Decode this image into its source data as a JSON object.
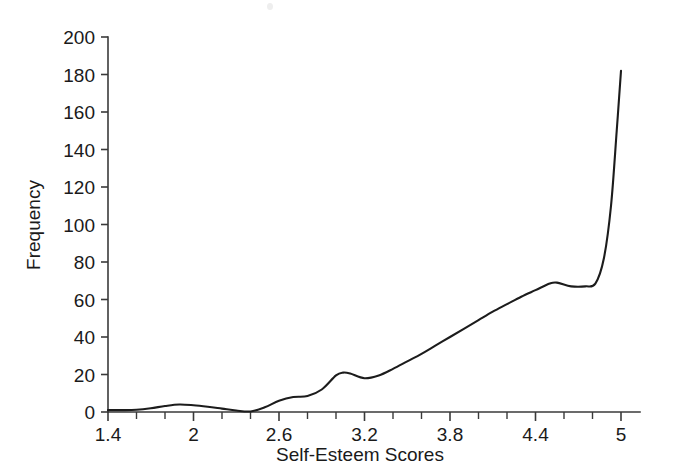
{
  "chart_data": {
    "type": "line",
    "title": "",
    "xlabel": "Self-Esteem Scores",
    "ylabel": "Frequency",
    "xlim": [
      1.4,
      5.0
    ],
    "ylim": [
      0,
      200
    ],
    "grid": false,
    "legend": null,
    "x_ticks": [
      1.4,
      1.6,
      1.8,
      2.0,
      2.2,
      2.4,
      2.6,
      2.8,
      3.0,
      3.2,
      3.4,
      3.6,
      3.8,
      4.0,
      4.2,
      4.4,
      4.6,
      4.8,
      5.0
    ],
    "x_tick_labels": [
      "1.4",
      "",
      "",
      "2",
      "",
      "",
      "2.6",
      "",
      "",
      "3.2",
      "",
      "",
      "3.8",
      "",
      "",
      "4.4",
      "",
      "",
      "5"
    ],
    "y_ticks": [
      0,
      20,
      40,
      60,
      80,
      100,
      120,
      140,
      160,
      180,
      200
    ],
    "y_tick_labels": [
      "0",
      "20",
      "40",
      "60",
      "80",
      "100",
      "120",
      "140",
      "160",
      "180",
      "200"
    ],
    "series": [
      {
        "name": "Frequency",
        "color": "#1c1c1c",
        "x": [
          1.4,
          1.5,
          1.6,
          1.7,
          1.8,
          1.9,
          2.0,
          2.1,
          2.2,
          2.3,
          2.4,
          2.5,
          2.6,
          2.7,
          2.8,
          2.9,
          3.0,
          3.05,
          3.1,
          3.2,
          3.3,
          3.4,
          3.5,
          3.6,
          3.7,
          3.8,
          3.9,
          4.0,
          4.1,
          4.2,
          4.3,
          4.4,
          4.5,
          4.55,
          4.65,
          4.75,
          4.82,
          4.88,
          4.93,
          4.97,
          5.0
        ],
        "y": [
          1.0,
          1.0,
          1.2,
          2.0,
          3.2,
          4.0,
          3.6,
          2.8,
          1.8,
          0.8,
          0.3,
          2.5,
          6.0,
          8.0,
          8.5,
          12.0,
          19.5,
          21.0,
          20.5,
          18.0,
          19.5,
          23.0,
          27.0,
          31.0,
          35.5,
          40.0,
          44.5,
          49.0,
          53.5,
          57.5,
          61.5,
          65.0,
          68.5,
          69.0,
          67.0,
          67.0,
          68.5,
          82.0,
          110.0,
          150.0,
          182.0
        ]
      }
    ]
  },
  "plot_geometry": {
    "left": 108,
    "right": 621,
    "axis_right_end": 640,
    "top": 37,
    "bottom": 412
  },
  "figure": {
    "background_color": "#ffffff",
    "line_color": "#1c1c1c",
    "axis_color": "#3a3a3a",
    "text_color": "#1a1a1a"
  }
}
